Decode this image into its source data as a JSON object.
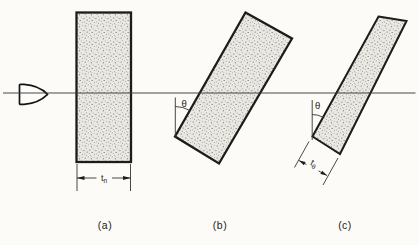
{
  "figure": {
    "description_labels": {
      "theta": "θ"
    },
    "panels": [
      {
        "label": "(a)",
        "thickness": {
          "base": "t",
          "sub": "n"
        }
      },
      {
        "label": "(b)",
        "angle": "θ"
      },
      {
        "label": "(c)",
        "angle": "θ",
        "thickness": {
          "base": "t",
          "sub": "θ"
        }
      }
    ]
  },
  "colors": {
    "background": "#fcfbf8",
    "ink": "#1c1c1a",
    "plate_fill": "#eae8e2",
    "stipple_dot": "#4a473f",
    "trajectory_line": "#3d3d3b"
  }
}
